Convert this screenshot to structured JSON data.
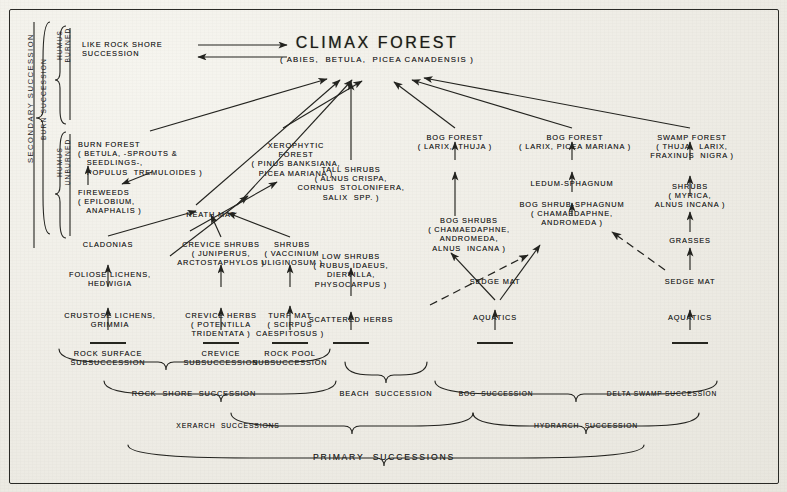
{
  "figure": {
    "title": "CLIMAX FOREST",
    "title_species": "( ABIES,  BETULA,  PICEA CANADENSIS )"
  },
  "side_labels": {
    "secondary_succession": "SECONDARY SUCCESSION",
    "burn_succession": "BURN SUCCESSION",
    "humus_burned": "HUMUS\nBURNED",
    "humus_unburned": "HUMUS\nUNBURNED"
  },
  "nodes": {
    "like_rock_shore": "LIKE ROCK SHORE\nSUCCESSION",
    "burn_forest": "BURN FOREST\n( BETULA, -SPROUTS &\n   SEEDLINGS-,\n   POPULUS  TREMULOIDES )",
    "fireweeds": "FIREWEEDS\n( EPILOBIUM,\n   ANAPHALIS )",
    "xerophytic_forest": "XEROPHYTIC\nFOREST\n( PINUS BANKSIANA,\nPICEA MARIANA )",
    "tall_shrubs": "TALL SHRUBS\n( ALNUS CRISPA,\nCORNUS  STOLONIFERA,\nSALIX  SPP. )",
    "bog_forest_thuja": "BOG FOREST\n( LARIX,  THUJA )",
    "bog_forest_picea": "BOG FOREST\n( LARIX, PICEA MARIANA )",
    "swamp_forest": "SWAMP FOREST\n( THUJA,  LARIX,\nFRAXINUS  NIGRA )",
    "ledum_sphagnum": "LEDUM-SPHAGNUM",
    "bog_shrub_sphagnum": "BOG SHRUB-SPHAGNUM\n( CHAMAEDAPHNE,\nANDROMEDA )",
    "shrubs_myrica": "SHRUBS\n( MYRICA,\nALNUS INCANA )",
    "heath_mat": "HEATH MAT",
    "bog_shrubs": "BOG SHRUBS\n( CHAMAEDAPHNE,\nANDROMEDA,\nALNUS  INCANA )",
    "cladonias": "CLADONIAS",
    "crevice_shrubs": "CREVICE SHRUBS\n( JUNIPERUS,\nARCTOSTAPHYLOS )",
    "shrubs_vaccinium": "SHRUBS\n( VACCINIUM\nULIGINOSUM )",
    "low_shrubs": "LOW SHRUBS\n( RUBUS IDAEUS,\nDIERVILLA,\nPHYSOCARPUS )",
    "grasses": "GRASSES",
    "foliose_lichens": "FOLIOSE LICHENS,\nHEDWIGIA",
    "crustose_lichens": "CRUSTOSE LICHENS,\nGRIMMIA",
    "crevice_herbs": "CREVICE HERBS\n( POTENTILLA\nTRIDENTATA )",
    "turf_mat": "TURF MAT\n( SCIRPUS\nCAESPITOSUS )",
    "scattered_herbs": "SCATTERED HERBS",
    "sedge_mat_bog": "SEDGE MAT",
    "sedge_mat_delta": "SEDGE MAT",
    "aquatics_bog": "AQUATICS",
    "aquatics_delta": "AQUATICS"
  },
  "subsuccessions": {
    "rock_surface": "ROCK SURFACE\nSUBSUCCESSION",
    "crevice": "CREVICE\nSUBSUCCESSION",
    "rock_pool": "ROCK POOL\nSUBSUCCESSION"
  },
  "groupings": {
    "rock_shore": "ROCK  SHORE  SUCCESSION",
    "beach": "BEACH  SUCCESSION",
    "bog": "BOG  SUCCESSION",
    "delta_swamp": "DELTA SWAMP SUCCESSION",
    "xerarch": "XERARCH  SUCCESSIONS",
    "hydrarch": "HYDRARCH  SUCCESSION",
    "primary": "PRIMARY  SUCCESSIONS"
  },
  "colors": {
    "ink": "#23231f",
    "paper": "#efeee7"
  }
}
